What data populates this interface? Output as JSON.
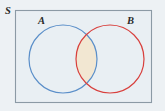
{
  "figure": {
    "type": "venn-diagram",
    "universal_set": {
      "label": "S",
      "label_position": "outside-top-left",
      "rect": {
        "x": 15,
        "y": 10,
        "width": 137,
        "height": 93
      },
      "fill": "#e9eff3",
      "border_color": "#8c9aa5"
    },
    "sets": [
      {
        "id": "A",
        "label": "A",
        "stroke": "#5b8fc9",
        "fill": "none",
        "cx": 63,
        "cy": 59,
        "r": 34,
        "label_x": 42,
        "label_y": 23
      },
      {
        "id": "B",
        "label": "B",
        "stroke": "#d8403d",
        "fill": "none",
        "cx": 110,
        "cy": 59,
        "r": 34,
        "label_x": 131,
        "label_y": 23
      }
    ],
    "shaded_region": {
      "name": "A-intersect-B",
      "fill": "#f2e7d2",
      "description": "lens-shaped intersection of circle A and circle B"
    },
    "background_color": "#edf1f4"
  }
}
